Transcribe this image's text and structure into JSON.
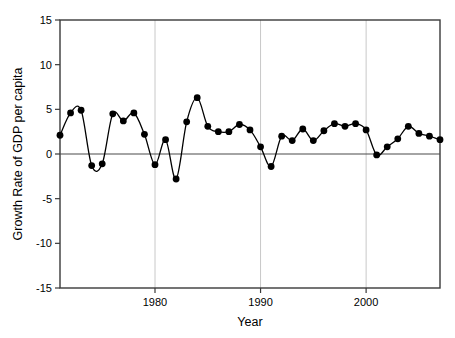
{
  "chart_data": {
    "type": "line",
    "title": "",
    "xlabel": "Year",
    "ylabel": "Growth Rate of GDP per capita",
    "xlim": [
      1971,
      2007
    ],
    "ylim": [
      -15,
      15
    ],
    "grid": "vertical-gridlines-at-x-ticks",
    "legend": "none",
    "marker": "filled-circle",
    "marker_color": "#000000",
    "line_color": "#000000",
    "zero_line": 0,
    "yticks": [
      -15,
      -10,
      -5,
      0,
      5,
      10,
      15
    ],
    "ytick_labels": [
      "-15",
      "-10",
      "-5",
      "0",
      "5",
      "10",
      "15"
    ],
    "xticks": [
      1980,
      1990,
      2000
    ],
    "xtick_labels": [
      "1980",
      "1990",
      "2000"
    ],
    "x": [
      1971,
      1972,
      1973,
      1974,
      1975,
      1976,
      1977,
      1978,
      1979,
      1980,
      1981,
      1982,
      1983,
      1984,
      1985,
      1986,
      1987,
      1988,
      1989,
      1990,
      1991,
      1992,
      1993,
      1994,
      1995,
      1996,
      1997,
      1998,
      1999,
      2000,
      2001,
      2002,
      2003,
      2004,
      2005,
      2006,
      2007
    ],
    "values": [
      2.1,
      4.6,
      4.9,
      -1.3,
      -1.1,
      4.5,
      3.7,
      4.6,
      2.2,
      -1.2,
      1.6,
      -2.8,
      3.6,
      6.3,
      3.1,
      2.5,
      2.5,
      3.3,
      2.7,
      0.8,
      -1.4,
      2.0,
      1.5,
      2.8,
      1.5,
      2.6,
      3.4,
      3.1,
      3.4,
      2.7,
      -0.1,
      0.8,
      1.7,
      3.1,
      2.3,
      2.0,
      1.6
    ]
  },
  "axes": {
    "x_title": "Year",
    "y_title": "Growth Rate of GDP per capita"
  }
}
